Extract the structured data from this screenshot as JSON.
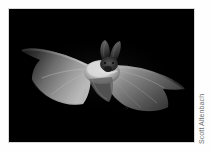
{
  "figure": {
    "type": "photograph",
    "background_color": "#ffffff",
    "plate_color": "#000000",
    "border_color": "#d8d8d8"
  },
  "photo": {
    "alt": "A pale long-eared bat photographed in flight with wings fully outstretched against a black background",
    "orientation": "landscape"
  },
  "credit": {
    "text": "Scott Altenbach",
    "color": "#6d6d6d",
    "orientation": "vertical-bottom-to-top"
  }
}
